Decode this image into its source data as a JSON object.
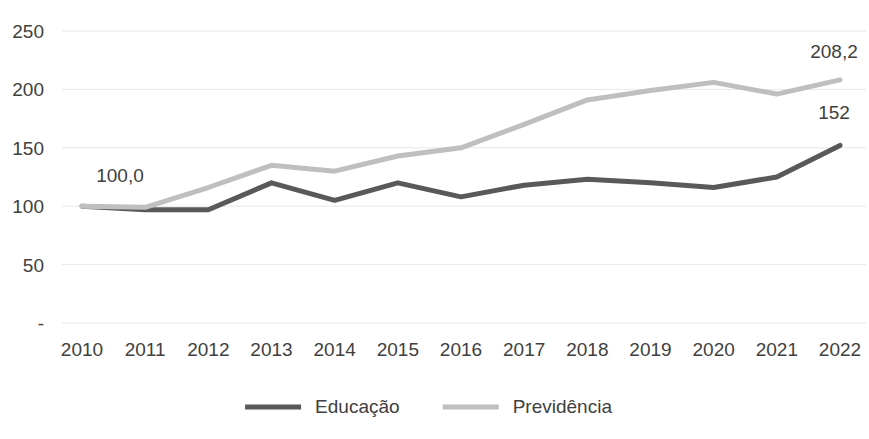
{
  "chart_data": {
    "type": "line",
    "title": "",
    "subtitle": "",
    "xlabel": "",
    "ylabel": "",
    "categories": [
      "2010",
      "2011",
      "2012",
      "2013",
      "2014",
      "2015",
      "2016",
      "2017",
      "2018",
      "2019",
      "2020",
      "2021",
      "2022"
    ],
    "series": [
      {
        "name": "Educação",
        "color": "#595959",
        "values": [
          100.0,
          97,
          97,
          120,
          105,
          120,
          108,
          118,
          123,
          120,
          116,
          125,
          152
        ]
      },
      {
        "name": "Previdência",
        "color": "#bfbfbf",
        "values": [
          100.0,
          99,
          116,
          135,
          130,
          143,
          150,
          170,
          191,
          199,
          206,
          196,
          208.2
        ]
      }
    ],
    "ylim": [
      0,
      250
    ],
    "ytick_values": [
      0,
      50,
      100,
      150,
      200,
      250
    ],
    "ytick_labels": [
      "-",
      "50",
      "100",
      "150",
      "200",
      "250"
    ],
    "grid": true,
    "legend_position": "bottom",
    "annotations": [
      {
        "text": "100,0",
        "series": "Previdência",
        "category": "2010",
        "value": 100.0,
        "anchor": "above-right"
      },
      {
        "text": "208,2",
        "series": "Previdência",
        "category": "2022",
        "value": 208.2,
        "anchor": "above"
      },
      {
        "text": "152",
        "series": "Educação",
        "category": "2022",
        "value": 152,
        "anchor": "above"
      }
    ]
  },
  "colors": {
    "educacao": "#595959",
    "previdencia": "#bfbfbf",
    "gridline": "#e8e8e8",
    "text": "#404040",
    "background": "#ffffff"
  }
}
